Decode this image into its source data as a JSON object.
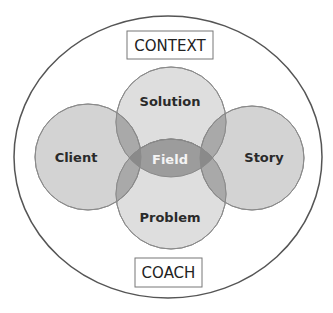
{
  "diagram": {
    "outer": {
      "label_top": "CONTEXT",
      "label_bottom": "COACH"
    },
    "circles": [
      {
        "id": "solution",
        "label": "Solution"
      },
      {
        "id": "client",
        "label": "Client"
      },
      {
        "id": "story",
        "label": "Story"
      },
      {
        "id": "problem",
        "label": "Problem"
      }
    ],
    "center": {
      "label": "Field"
    },
    "colors": {
      "outer_stroke": "#555555",
      "circle_fill": "#d6d6d6",
      "circle_stroke": "#8a8a8a",
      "overlap_fill": "#a8a8a8",
      "field_fill": "#9a9a9a",
      "field_text": "#f4f4f4",
      "label_text": "#2a2a2a"
    }
  }
}
